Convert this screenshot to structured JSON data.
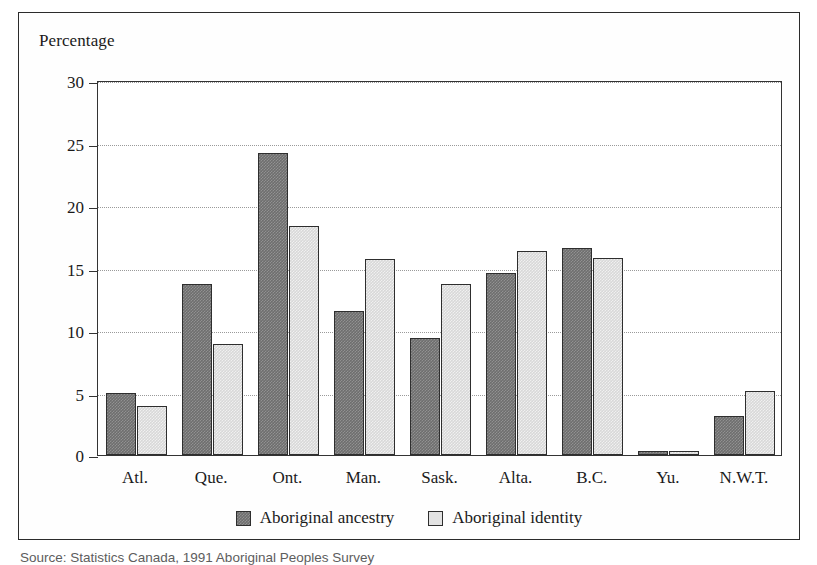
{
  "figure": {
    "axis_title": "Percentage",
    "source_note": "Source: Statistics Canada, 1991 Aboriginal Peoples Survey"
  },
  "legend": {
    "entries": [
      {
        "label": "Aboriginal ancestry",
        "swatch": "dark-hatched-swatch",
        "color": "#6e6e6e"
      },
      {
        "label": "Aboriginal identity",
        "swatch": "light-swatch",
        "color": "#e2e2e2"
      }
    ]
  },
  "chart_data": {
    "type": "bar",
    "title": "",
    "xlabel": "",
    "ylabel": "Percentage",
    "ylim": [
      0,
      30
    ],
    "yticks": [
      0,
      5,
      10,
      15,
      20,
      25,
      30
    ],
    "grid": true,
    "legend_position": "bottom-center",
    "categories": [
      "Atl.",
      "Que.",
      "Ont.",
      "Man.",
      "Sask.",
      "Alta.",
      "B.C.",
      "Yu.",
      "N.W.T."
    ],
    "series": [
      {
        "name": "Aboriginal ancestry",
        "color": "#6e6e6e",
        "values": [
          5.0,
          13.7,
          24.2,
          11.5,
          9.4,
          14.6,
          16.6,
          0.3,
          3.1
        ]
      },
      {
        "name": "Aboriginal identity",
        "color": "#e2e2e2",
        "values": [
          3.9,
          8.9,
          18.3,
          15.7,
          13.7,
          16.3,
          15.8,
          0.3,
          5.1
        ]
      }
    ]
  }
}
